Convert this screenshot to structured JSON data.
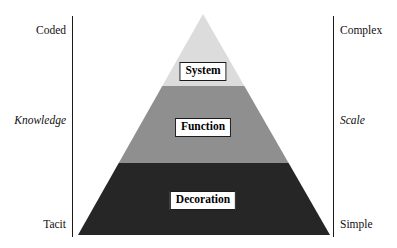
{
  "diagram": {
    "type": "pyramid",
    "background_color": "#ffffff",
    "axis_color": "#1a1a1a"
  },
  "left_axis": {
    "name": "Knowledge",
    "name_style": "italic",
    "top_label": "Coded",
    "middle_label": "Knowledge",
    "bottom_label": "Tacit"
  },
  "right_axis": {
    "name": "Scale",
    "name_style": "italic",
    "top_label": "Complex",
    "middle_label": "Scale",
    "bottom_label": "Simple"
  },
  "pyramid": {
    "apex": {
      "x": 203,
      "y": 14
    },
    "base": {
      "left_x": 78,
      "right_x": 330,
      "y": 235
    },
    "tiers": [
      {
        "label": "System",
        "color": "#dcdcdc",
        "position": "top",
        "top_y": 14,
        "bottom_y": 86
      },
      {
        "label": "Function",
        "color": "#8f8f8f",
        "position": "middle",
        "top_y": 86,
        "bottom_y": 163
      },
      {
        "label": "Decoration",
        "color": "#262626",
        "position": "bottom",
        "top_y": 163,
        "bottom_y": 235
      }
    ]
  }
}
